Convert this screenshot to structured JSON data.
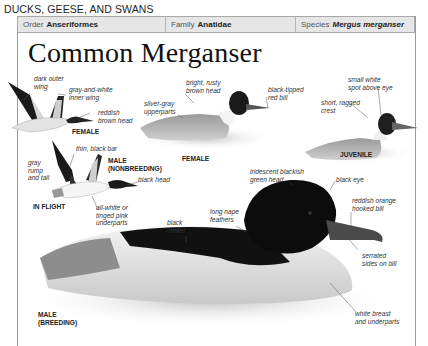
{
  "section": {
    "title": "DUCKS, GEESE, AND SWANS"
  },
  "taxonomy": {
    "order": {
      "label": "Order",
      "value": "Anseriformes"
    },
    "family": {
      "label": "Family",
      "value": "Anatidae"
    },
    "species": {
      "label": "Species",
      "value": "Mergus merganser"
    }
  },
  "species_name": "Common Merganser",
  "figures": {
    "female_flight": {
      "caption": "FEMALE",
      "labels": {
        "dark_outer_wing_1": "dark outer",
        "dark_outer_wing_2": "wing",
        "inner_wing_1": "gray-and-white",
        "inner_wing_2": "inner wing",
        "head_1": "reddish",
        "head_2": "brown head"
      }
    },
    "female_swimming": {
      "caption": "FEMALE",
      "labels": {
        "head_1": "bright, rusty",
        "head_2": "brown head",
        "upperparts_1": "silver-gray",
        "upperparts_2": "upperparts",
        "bill_1": "black-tipped",
        "bill_2": "red bill"
      }
    },
    "juvenile": {
      "caption": "JUVENILE",
      "labels": {
        "spot_1": "small white",
        "spot_2": "spot above eye",
        "crest_1": "short, ragged",
        "crest_2": "crest"
      }
    },
    "male_flight": {
      "caption_1": "MALE",
      "caption_2": "(NONBREEDING)",
      "group_caption": "IN FLIGHT",
      "labels": {
        "bar": "thin, black bar",
        "rump_1": "gray",
        "rump_2": "rump",
        "rump_3": "and tail",
        "head": "black head",
        "underparts_1": "all-white or",
        "underparts_2": "tinged pink",
        "underparts_3": "underparts"
      }
    },
    "male_breeding": {
      "caption_1": "MALE",
      "caption_2": "(BREEDING)",
      "labels": {
        "head_1": "iridescent blackish",
        "head_2": "green head",
        "eye": "black eye",
        "bill_1": "reddish orange",
        "bill_2": "hooked bill",
        "nape_1": "long nape",
        "nape_2": "feathers",
        "center_1": "black",
        "center_2": "center",
        "serrated_1": "serrated",
        "serrated_2": "sides on bill",
        "breast_1": "white breast",
        "breast_2": "and underparts"
      }
    }
  }
}
